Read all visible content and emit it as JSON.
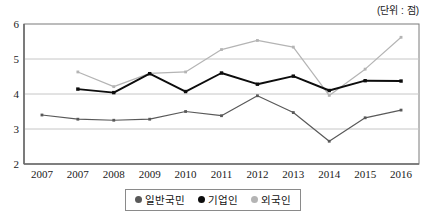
{
  "unit_note": "(단위 : 점)",
  "legend": {
    "position": "bottom-center",
    "items": [
      {
        "label": "일반국민",
        "color": "#595959",
        "key": "general_public"
      },
      {
        "label": "기업인",
        "color": "#0d0d0d",
        "key": "business_people"
      },
      {
        "label": "외국인",
        "color": "#b4b4b4",
        "key": "foreigners"
      }
    ]
  },
  "chart_data": {
    "type": "line",
    "title": "",
    "subtitle": "",
    "xlabel": "",
    "ylabel": "",
    "unit": "점",
    "unit_note": "(단위 : 점)",
    "categories": [
      "2007",
      "2007",
      "2008",
      "2009",
      "2010",
      "2011",
      "2012",
      "2013",
      "2014",
      "2015",
      "2016"
    ],
    "ylim": [
      2,
      6
    ],
    "yticks": [
      2,
      3,
      4,
      5,
      6
    ],
    "ytick_labels": [
      "2",
      "3",
      "4",
      "5",
      "6"
    ],
    "grid": true,
    "grid_axis": "y",
    "legend_position": "bottom",
    "markers": "square",
    "series": [
      {
        "name": "일반국민",
        "color": "#595959",
        "values": [
          3.4,
          3.28,
          3.25,
          3.28,
          3.5,
          3.38,
          3.95,
          3.47,
          2.65,
          3.32,
          3.54
        ]
      },
      {
        "name": "기업인",
        "color": "#0d0d0d",
        "values": [
          null,
          4.14,
          4.04,
          4.58,
          4.07,
          4.6,
          4.28,
          4.51,
          4.1,
          4.38,
          4.37
        ]
      },
      {
        "name": "외국인",
        "color": "#b4b4b4",
        "values": [
          null,
          4.63,
          4.21,
          4.59,
          4.63,
          5.27,
          5.53,
          5.34,
          3.96,
          4.71,
          5.62
        ]
      }
    ]
  }
}
